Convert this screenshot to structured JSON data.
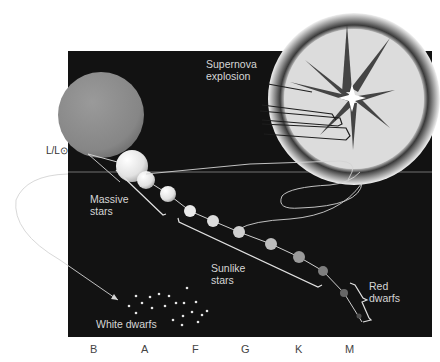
{
  "diagram": {
    "title": "",
    "y_axis_label": "L/L⊙",
    "x_axis": {
      "ticks": [
        {
          "label": "B",
          "x": 94
        },
        {
          "label": "A",
          "x": 145
        },
        {
          "label": "F",
          "x": 195
        },
        {
          "label": "G",
          "x": 245
        },
        {
          "label": "K",
          "x": 299
        },
        {
          "label": "M",
          "x": 350
        }
      ]
    },
    "labels": {
      "supernova": "Supernova\nexplosion",
      "massive_stars": "Massive\nstars",
      "sunlike_stars": "Sunlike\nstars",
      "red_dwarfs": "Red\ndwarfs",
      "white_dwarfs": "White dwarfs"
    },
    "colors": {
      "panel": "#121212",
      "red_giant": "#8a8a8a",
      "star_light": "#f0f0f0",
      "curve": "#d8d8d8",
      "supernova_disc": "#dedede"
    },
    "main_sequence_stars": [
      {
        "cx": 132,
        "cy": 166,
        "r": 16,
        "shade": "#f2f2f2"
      },
      {
        "cx": 146,
        "cy": 180,
        "r": 9,
        "shade": "#e6e6e6"
      },
      {
        "cx": 168,
        "cy": 194,
        "r": 8,
        "shade": "#e0e0e0"
      },
      {
        "cx": 190,
        "cy": 211,
        "r": 6,
        "shade": "#e8e8e8"
      },
      {
        "cx": 213,
        "cy": 221,
        "r": 6,
        "shade": "#dcdcdc"
      },
      {
        "cx": 239,
        "cy": 232,
        "r": 6,
        "shade": "#cfcfcf"
      },
      {
        "cx": 271,
        "cy": 244,
        "r": 6,
        "shade": "#bdbdbd"
      },
      {
        "cx": 299,
        "cy": 257,
        "r": 6,
        "shade": "#9a9a9a"
      },
      {
        "cx": 323,
        "cy": 271,
        "r": 5,
        "shade": "#7d7d7d"
      },
      {
        "cx": 344,
        "cy": 293,
        "r": 4,
        "shade": "#626262"
      },
      {
        "cx": 359,
        "cy": 316,
        "r": 2.5,
        "shade": "#4d4d4d"
      }
    ]
  }
}
